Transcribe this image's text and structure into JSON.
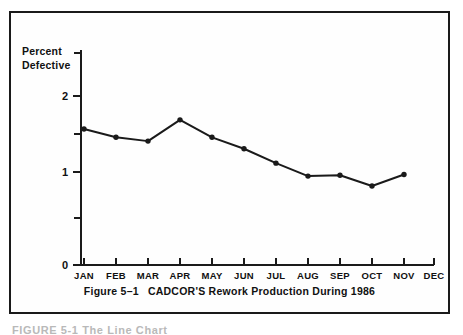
{
  "figure": {
    "caption_number": "Figure 5–1",
    "caption_title": "CADCOR'S Rework Production During 1986",
    "bottom_cut_text": "FIGURE 5-1   The Line Chart",
    "border_color": "#1a1a1a",
    "background_color": "#ffffff"
  },
  "chart_data": {
    "type": "line",
    "title": "CADCOR'S Rework Production During 1986",
    "xlabel": "",
    "ylabel": "Percent Defective",
    "ylabel_line1": "Percent",
    "ylabel_line2": "Defective",
    "categories": [
      "JAN",
      "FEB",
      "MAR",
      "APR",
      "MAY",
      "JUN",
      "JUL",
      "AUG",
      "SEP",
      "OCT",
      "NOV",
      "DEC"
    ],
    "values": [
      1.79,
      1.68,
      1.63,
      1.91,
      1.68,
      1.53,
      1.34,
      1.17,
      1.18,
      1.04,
      1.19,
      null
    ],
    "series": [
      {
        "name": "Percent Defective",
        "values": [
          1.79,
          1.68,
          1.63,
          1.91,
          1.68,
          1.53,
          1.34,
          1.17,
          1.18,
          1.04,
          1.19,
          null
        ]
      }
    ],
    "ylim": [
      0,
      2.3
    ],
    "y_major_ticks": [
      0,
      1,
      2
    ],
    "y_major_tick_labels": [
      "0",
      "1",
      "2"
    ],
    "y_minor_ticks": [
      0.5,
      1.5,
      2.25
    ],
    "grid": false,
    "legend": false,
    "legend_position": "none",
    "line_color": "#1a1a1a",
    "marker_color": "#1a1a1a",
    "marker_shape": "circle",
    "axis_color": "#1a1a1a"
  }
}
